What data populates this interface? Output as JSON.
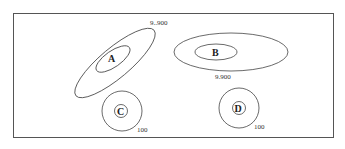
{
  "diagram": {
    "frame": {
      "x": 13,
      "y": 13,
      "w": 321,
      "h": 125,
      "stroke": "#555555"
    },
    "clusters": [
      {
        "id": "A",
        "label": "A",
        "value_label": "9..900",
        "shape": "ellipse-rotated"
      },
      {
        "id": "B",
        "label": "B",
        "value_label": "9.900",
        "shape": "ellipse"
      },
      {
        "id": "C",
        "label": "C",
        "value_label": "100",
        "shape": "circle"
      },
      {
        "id": "D",
        "label": "D",
        "value_label": "100",
        "shape": "circle"
      }
    ]
  }
}
